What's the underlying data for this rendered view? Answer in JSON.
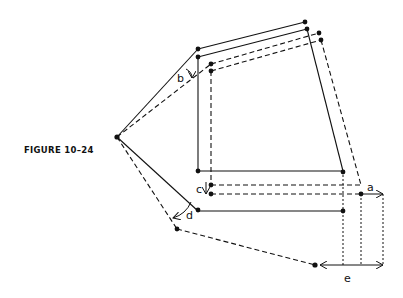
{
  "figure": {
    "caption": "FIGURE 10–24",
    "labels": {
      "a": "a",
      "b": "b",
      "c": "c",
      "d": "d",
      "e": "e"
    },
    "line_styles": {
      "original": "solid",
      "displaced": "dashed",
      "projection": "dotted"
    },
    "color": "#111111"
  }
}
